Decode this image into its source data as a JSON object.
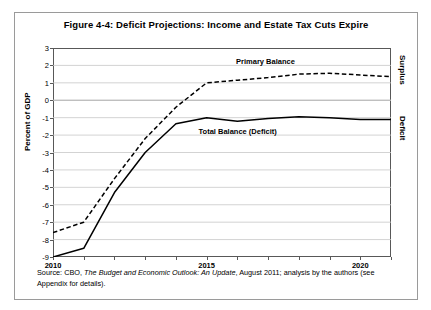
{
  "figure": {
    "title": "Figure 4-4: Deficit Projections: Income and Estate Tax Cuts Expire",
    "ylabel": "Percent of GDP",
    "right_top_label": "Surplus",
    "right_bottom_label": "Deficit",
    "source_prefix": "Source: CBO, ",
    "source_italic1": "The Budget and Economic Outlook: An Update",
    "source_mid": ", August 2011; analysis by the authors (see Appendix for details)."
  },
  "chart_data": {
    "type": "line",
    "title": "Figure 4-4: Deficit Projections: Income and Estate Tax Cuts Expire",
    "xlabel": "",
    "ylabel": "Percent of GDP",
    "xlim": [
      2010,
      2021
    ],
    "ylim": [
      -9,
      3
    ],
    "yticks": [
      3,
      2,
      1,
      0,
      -1,
      -2,
      -3,
      -4,
      -5,
      -6,
      -7,
      -8,
      -9
    ],
    "xticks": [
      2010,
      2015,
      2020
    ],
    "xtick_labels": [
      "2010",
      "2015",
      "2020"
    ],
    "minor_xticks": [
      2011,
      2012,
      2013,
      2014,
      2016,
      2017,
      2018,
      2019,
      2021
    ],
    "grid": "horizontal",
    "legend": "inline-annotations",
    "x": [
      2010,
      2011,
      2012,
      2013,
      2014,
      2015,
      2016,
      2017,
      2018,
      2019,
      2020,
      2021
    ],
    "series": [
      {
        "name": "Primary Balance",
        "style": "dashed",
        "color": "#000000",
        "values": [
          -7.6,
          -7.0,
          -4.5,
          -2.2,
          -0.4,
          1.0,
          1.15,
          1.3,
          1.5,
          1.55,
          1.45,
          1.35
        ]
      },
      {
        "name": "Total Balance (Deficit)",
        "style": "solid",
        "color": "#000000",
        "values": [
          -9.0,
          -8.5,
          -5.3,
          -3.0,
          -1.35,
          -1.0,
          -1.2,
          -1.05,
          -0.95,
          -1.0,
          -1.1,
          -1.1
        ]
      }
    ],
    "annotations": [
      {
        "text": "Primary Balance",
        "x": 2017.0,
        "y": 2.2
      },
      {
        "text": "Total Balance (Deficit)",
        "x": 2016.3,
        "y": -1.85
      }
    ]
  }
}
